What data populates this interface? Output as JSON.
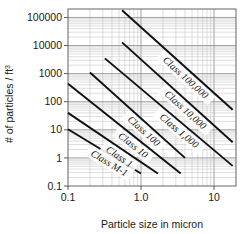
{
  "chart_data": {
    "type": "line",
    "title": "",
    "xlabel": "Particle size in micron",
    "ylabel": "# of particles / ft3",
    "ylabel_base": "# of particles / ft",
    "ylabel_sup": "3",
    "xscale": "log",
    "yscale": "log",
    "xlim": [
      0.1,
      20
    ],
    "ylim": [
      0.1,
      200000
    ],
    "grid": "log-log minor grid",
    "legend": "inline labels on each line",
    "xticks": [
      {
        "value": 0.1,
        "label": "0.1"
      },
      {
        "value": 1.0,
        "label": "1.0"
      },
      {
        "value": 10,
        "label": "10"
      }
    ],
    "yticks": [
      {
        "value": 100000,
        "label": "100000"
      },
      {
        "value": 10000,
        "label": "10000"
      },
      {
        "value": 1000,
        "label": "1000"
      },
      {
        "value": 100,
        "label": "100"
      },
      {
        "value": 10,
        "label": "10"
      },
      {
        "value": 1,
        "label": "1"
      },
      {
        "value": 0.1,
        "label": "0.1"
      }
    ],
    "slope": -2.2,
    "series": [
      {
        "name": "Class 100,000",
        "label": "Class 100,000",
        "points": [
          [
            0.55,
            180000
          ],
          [
            18.0,
            52
          ]
        ]
      },
      {
        "name": "Class 10,000",
        "label": "Class 10,000",
        "points": [
          [
            0.55,
            13000
          ],
          [
            18.0,
            3.6
          ]
        ]
      },
      {
        "name": "Class 1,000",
        "label": "Class 1,000",
        "points": [
          [
            0.32,
            3500
          ],
          [
            18.0,
            0.52
          ]
        ]
      },
      {
        "name": "Class 100",
        "label": "Class 100",
        "points": [
          [
            0.2,
            1100
          ],
          [
            4.0,
            1.0
          ]
        ]
      },
      {
        "name": "Class 10",
        "label": "Class 10",
        "points": [
          [
            0.1,
            440
          ],
          [
            3.5,
            0.28
          ]
        ]
      },
      {
        "name": "Class 1",
        "label": "Class 1",
        "points": [
          [
            0.1,
            40
          ],
          [
            1.7,
            0.28
          ]
        ]
      },
      {
        "name": "Class M-1",
        "label": "Class M-1",
        "points": [
          [
            0.1,
            10.5
          ],
          [
            1.0,
            0.28
          ]
        ]
      }
    ]
  },
  "colors": {
    "line": "#101010",
    "grid_major": "#8a8a8a",
    "grid_minor": "#bdbdbd",
    "axis": "#4a4a4a",
    "text": "#1a1a1a",
    "background": "#ffffff"
  }
}
